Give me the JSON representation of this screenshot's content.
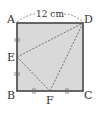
{
  "figure": {
    "type": "geometry",
    "shape": "square ABCD",
    "dimension_label": "12 cm",
    "fill_color": "#d9d9d9",
    "stroke_color": "#444444",
    "dashed_color": "#555555",
    "vertices": {
      "A": {
        "label": "A"
      },
      "B": {
        "label": "B"
      },
      "C": {
        "label": "C"
      },
      "D": {
        "label": "D"
      },
      "E": {
        "label": "E"
      },
      "F": {
        "label": "F"
      }
    },
    "segments_dashed": [
      "ED",
      "EF",
      "FD"
    ],
    "equal_marks": [
      "AE = EB",
      "BF = FC"
    ]
  }
}
